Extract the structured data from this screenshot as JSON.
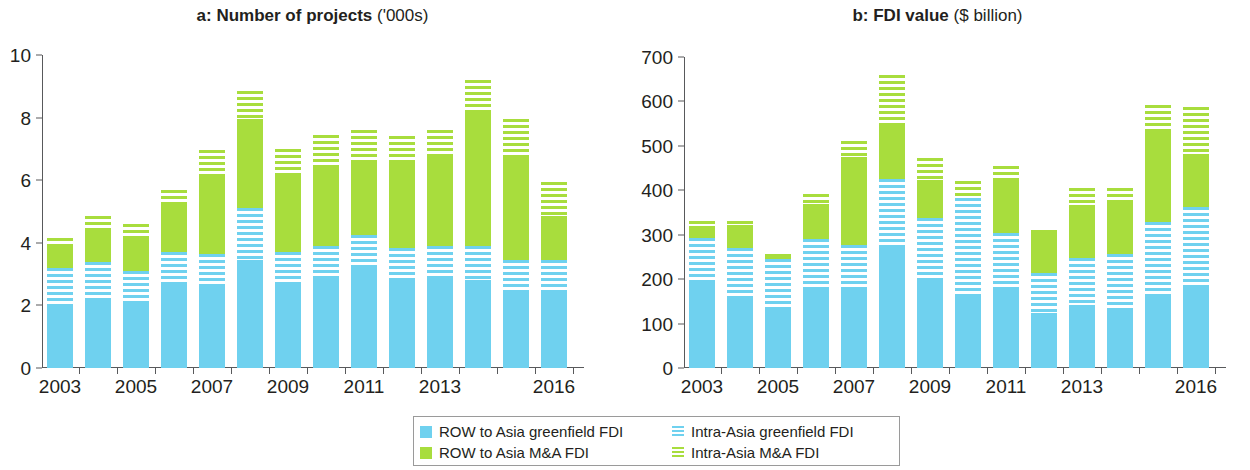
{
  "figure": {
    "legend": {
      "entries": [
        {
          "label": "ROW to Asia greenfield FDI",
          "style": "solid-blue",
          "color": "#6fd1ef"
        },
        {
          "label": "Intra-Asia greenfield FDI",
          "style": "stripe-blue",
          "color": "#6fd1ef"
        },
        {
          "label": "ROW to Asia M&A FDI",
          "style": "solid-green",
          "color": "#a8dd3d"
        },
        {
          "label": "Intra-Asia M&A FDI",
          "style": "stripe-green",
          "color": "#a8dd3d"
        }
      ]
    }
  },
  "chart_data": [
    {
      "type": "bar",
      "panel_letter": "a:",
      "title": "Number of projects",
      "title_unit": "('000s)",
      "stacked": true,
      "xlabel": "",
      "ylabel": "",
      "ylim": [
        0,
        10
      ],
      "yticks": [
        0,
        2,
        4,
        6,
        8,
        10
      ],
      "ytick_labels": [
        "0",
        "2",
        "4",
        "6",
        "8",
        "10"
      ],
      "grid": false,
      "legend_position": "bottom-center",
      "categories": [
        2003,
        2004,
        2005,
        2006,
        2007,
        2008,
        2009,
        2010,
        2011,
        2012,
        2013,
        2014,
        2015,
        2016
      ],
      "xtick_labels": [
        "2003",
        "",
        "2005",
        "",
        "2007",
        "",
        "2009",
        "",
        "2011",
        "",
        "2013",
        "",
        "",
        "2016"
      ],
      "series": [
        {
          "name": "ROW to Asia greenfield FDI",
          "style": "solid-blue",
          "values": [
            1.95,
            2.25,
            2.15,
            2.7,
            2.6,
            3.45,
            2.75,
            2.9,
            3.25,
            2.8,
            2.9,
            2.8,
            2.45,
            2.5
          ]
        },
        {
          "name": "Intra-Asia greenfield FDI",
          "style": "stripe-blue",
          "values": [
            1.25,
            1.15,
            0.95,
            1.0,
            1.05,
            1.65,
            0.95,
            1.0,
            1.0,
            1.05,
            1.0,
            1.1,
            1.0,
            0.95
          ]
        },
        {
          "name": "ROW to Asia M&A FDI",
          "style": "solid-green",
          "values": [
            0.7,
            1.05,
            1.1,
            1.6,
            2.55,
            2.85,
            2.5,
            2.6,
            2.4,
            2.8,
            2.85,
            4.25,
            3.25,
            1.4
          ]
        },
        {
          "name": "Intra-Asia M&A FDI",
          "style": "stripe-green",
          "values": [
            0.25,
            0.4,
            0.4,
            0.4,
            0.75,
            0.9,
            0.8,
            0.95,
            0.95,
            0.75,
            0.85,
            1.05,
            1.25,
            1.1
          ]
        }
      ]
    },
    {
      "type": "bar",
      "panel_letter": "b:",
      "title": "FDI value",
      "title_unit": "($ billion)",
      "stacked": true,
      "xlabel": "",
      "ylabel": "",
      "ylim": [
        0,
        700
      ],
      "yticks": [
        0,
        100,
        200,
        300,
        400,
        500,
        600,
        700
      ],
      "ytick_labels": [
        "0",
        "100",
        "200",
        "300",
        "400",
        "500",
        "600",
        "700"
      ],
      "grid": false,
      "legend_position": "bottom-center",
      "categories": [
        2003,
        2004,
        2005,
        2006,
        2007,
        2008,
        2009,
        2010,
        2011,
        2012,
        2013,
        2014,
        2015,
        2016
      ],
      "xtick_labels": [
        "2003",
        "",
        "2005",
        "",
        "2007",
        "",
        "2009",
        "",
        "2011",
        "",
        "2013",
        "",
        "",
        "2016"
      ],
      "series": [
        {
          "name": "ROW to Asia greenfield FDI",
          "style": "solid-blue",
          "values": [
            197,
            160,
            133,
            182,
            183,
            273,
            199,
            164,
            179,
            124,
            141,
            131,
            160,
            179
          ]
        },
        {
          "name": "Intra-Asia greenfield FDI",
          "style": "stripe-blue",
          "values": [
            96,
            110,
            112,
            108,
            94,
            152,
            138,
            219,
            126,
            90,
            107,
            126,
            168,
            183
          ]
        },
        {
          "name": "ROW to Asia M&A FDI",
          "style": "solid-green",
          "values": [
            26,
            52,
            11,
            79,
            199,
            125,
            86,
            0,
            115,
            97,
            119,
            117,
            210,
            120
          ]
        },
        {
          "name": "Intra-Asia M&A FDI",
          "style": "stripe-green",
          "values": [
            11,
            8,
            0,
            22,
            35,
            110,
            49,
            38,
            35,
            0,
            39,
            32,
            53,
            105
          ]
        }
      ]
    }
  ]
}
